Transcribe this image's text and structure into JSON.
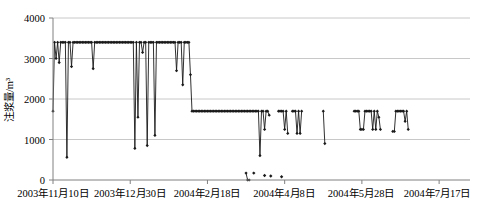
{
  "chart_data": {
    "type": "line",
    "title": "",
    "subtitle": "",
    "xlabel": "",
    "ylabel": "注浆量/m³",
    "ylim": [
      0,
      4000
    ],
    "yticks": [
      0,
      1000,
      2000,
      3000,
      4000
    ],
    "ytick_labels": [
      "0",
      "1000",
      "2000",
      "3000",
      "4000"
    ],
    "xtick_labels": [
      "2003年11月10日",
      "2003年12月30日",
      "2004年2月18日",
      "2004年4月8日",
      "2004年5月28日",
      "2004年7月17日"
    ],
    "xtick_index": [
      0,
      50,
      100,
      150,
      200,
      250
    ],
    "xlim": [
      0,
      270
    ],
    "grid": "horizontal",
    "legend": "none",
    "marker": "diamond",
    "series": [
      {
        "name": "注浆量",
        "x": [
          0,
          1,
          2,
          3,
          4,
          5,
          6,
          7,
          8,
          9,
          10,
          11,
          12,
          13,
          14,
          15,
          16,
          17,
          18,
          19,
          20,
          21,
          22,
          23,
          24,
          25,
          26,
          27,
          28,
          29,
          30,
          31,
          32,
          33,
          34,
          35,
          36,
          37,
          38,
          39,
          40,
          41,
          42,
          43,
          44,
          45,
          46,
          47,
          48,
          49,
          50,
          51,
          52,
          53,
          54,
          55,
          56,
          57,
          58,
          59,
          60,
          61,
          62,
          63,
          64,
          65,
          66,
          67,
          68,
          69,
          70,
          71,
          72,
          73,
          74,
          75,
          76,
          77,
          78,
          79,
          80,
          81,
          82,
          83,
          84,
          85,
          86,
          87,
          88,
          89,
          90,
          91,
          92,
          93,
          94,
          95,
          96,
          97,
          98,
          99,
          100,
          101,
          102,
          103,
          104,
          105,
          106,
          107,
          108,
          109,
          110,
          111,
          112,
          113,
          114,
          115,
          116,
          117,
          118,
          119,
          120,
          121,
          122,
          123,
          124,
          125,
          126,
          127,
          128,
          129,
          130,
          131,
          132,
          133,
          134,
          135,
          136,
          137,
          138,
          139,
          140
        ],
        "y": [
          1700,
          3400,
          3000,
          3400,
          2900,
          3400,
          3400,
          3400,
          3400,
          560,
          3400,
          3400,
          2800,
          3400,
          3400,
          3400,
          3400,
          3400,
          3400,
          3400,
          3400,
          3400,
          3400,
          3400,
          3400,
          3400,
          2750,
          3400,
          3400,
          3400,
          3400,
          3400,
          3400,
          3400,
          3400,
          3400,
          3400,
          3400,
          3400,
          3400,
          3400,
          3400,
          3400,
          3400,
          3400,
          3400,
          3400,
          3400,
          3400,
          3400,
          3400,
          3400,
          3400,
          780,
          3400,
          1550,
          3400,
          3400,
          3150,
          3400,
          3400,
          850,
          3400,
          3400,
          3400,
          3400,
          1100,
          3400,
          3400,
          3400,
          3400,
          3400,
          3400,
          3400,
          3400,
          3400,
          3400,
          3400,
          3400,
          3400,
          2700,
          3400,
          3400,
          3400,
          2350,
          3400,
          3400,
          3400,
          3400,
          2600,
          1700,
          1700,
          1700,
          1700,
          1700,
          1700,
          1700,
          1700,
          1700,
          1700,
          1700,
          1700,
          1700,
          1700,
          1700,
          1700,
          1700,
          1700,
          1700,
          1700,
          1700,
          1700,
          1700,
          1700,
          1700,
          1700,
          1700,
          1700,
          1700,
          1700,
          1700,
          1700,
          1700,
          1700,
          1700,
          1700,
          1700,
          1700,
          1700,
          1700,
          1700,
          1700,
          1700,
          1700,
          600,
          1700,
          1700,
          1250,
          1700,
          1700,
          1600
        ]
      },
      {
        "name": "注浆量-续1",
        "x": [
          146,
          147,
          148,
          149,
          150,
          151,
          152
        ],
        "y": [
          1700,
          1700,
          1700,
          1700,
          1250,
          1700,
          1150
        ]
      },
      {
        "name": "注浆量-续2",
        "x": [
          125,
          126,
          127
        ],
        "y": [
          170,
          0,
          0
        ]
      },
      {
        "name": "注浆量-续3",
        "x": [
          155,
          156,
          157,
          158,
          159,
          160,
          161
        ],
        "y": [
          1700,
          1700,
          1700,
          1150,
          1700,
          1150,
          1700
        ]
      },
      {
        "name": "注浆量-续4",
        "x": [
          175,
          176
        ],
        "y": [
          1700,
          900
        ]
      },
      {
        "name": "注浆量-续5",
        "x": [
          195,
          196,
          197,
          198,
          199,
          200,
          201,
          202,
          203,
          204,
          205,
          206,
          207,
          208,
          209,
          210,
          211,
          212
        ],
        "y": [
          1700,
          1700,
          1700,
          1700,
          1250,
          1250,
          1250,
          1700,
          1700,
          1700,
          1700,
          1700,
          1250,
          1700,
          1250,
          1700,
          1550,
          1250
        ]
      },
      {
        "name": "注浆量-续6",
        "x": [
          220,
          221,
          222,
          223,
          224,
          225,
          226,
          227,
          228,
          229,
          230
        ],
        "y": [
          1200,
          1200,
          1700,
          1700,
          1700,
          1700,
          1700,
          1700,
          1450,
          1700,
          1250
        ]
      }
    ],
    "scatter_points": [
      {
        "x": 130,
        "y": 170
      },
      {
        "x": 137,
        "y": 110
      },
      {
        "x": 141,
        "y": 100
      },
      {
        "x": 148,
        "y": 80
      }
    ]
  },
  "axis": {
    "y_axis_title": "注浆量/m³",
    "y_tick_0": "0",
    "y_tick_1": "1000",
    "y_tick_2": "2000",
    "y_tick_3": "3000",
    "y_tick_4": "4000",
    "x_tick_0": "2003年11月10日",
    "x_tick_1": "2003年12月30日",
    "x_tick_2": "2004年2月18日",
    "x_tick_3": "2004年4月8日",
    "x_tick_4": "2004年5月28日",
    "x_tick_5": "2004年7月17日"
  },
  "style": {
    "line_color": "#1a1a1a",
    "marker_color": "#1a1a1a",
    "grid_color": "#c8c8c8",
    "axis_color": "#808080",
    "background": "#ffffff"
  }
}
